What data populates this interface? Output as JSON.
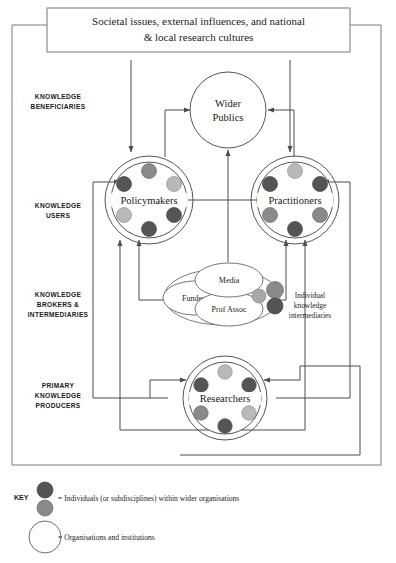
{
  "figure": {
    "banner": {
      "line1": "Societal issues, external influences, and national",
      "line2": "& local research cultures"
    },
    "tier_labels": [
      {
        "id": "beneficiaries",
        "line1": "KNOWLEDGE",
        "line2": "BENEFICIARIES",
        "line3": ""
      },
      {
        "id": "users",
        "line1": "KNOWLEDGE",
        "line2": "USERS",
        "line3": ""
      },
      {
        "id": "brokers",
        "line1": "KNOWLEDGE",
        "line2": "BROKERS &",
        "line3": "INTERMEDIARIES"
      },
      {
        "id": "producers",
        "line1": "PRIMARY",
        "line2": "KNOWLEDGE",
        "line3": "PRODUCERS"
      }
    ],
    "nodes": {
      "wider_publics": {
        "line1": "Wider",
        "line2": "Publics"
      },
      "policymakers": {
        "label": "Policymakers"
      },
      "practitioners": {
        "label": "Practitioners"
      },
      "researchers": {
        "label": "Researchers"
      },
      "media": {
        "label": "Media"
      },
      "funders": {
        "label": "Funders"
      },
      "prof_assoc": {
        "label": "Prof Assoc"
      }
    },
    "annotations": {
      "individual_intermediaries": {
        "line1": "Individual",
        "line2": "knowledge",
        "line3": "intermediaries"
      }
    },
    "key": {
      "title": "KEY",
      "items": [
        {
          "symbol": "filled-dots",
          "text": "= Individuals (or subdisciplines) within wider organisations"
        },
        {
          "symbol": "open-circle",
          "text": "= Organisations and institutions"
        }
      ]
    },
    "colors": {
      "dot_dark": "#555555",
      "dot_mid": "#8a8a8a",
      "dot_light": "#b9b9b9",
      "line": "#4a4a4a",
      "frame": "#7a7a7a",
      "background": "#ffffff"
    },
    "dot_groups": {
      "policymakers": [
        "mid",
        "dark",
        "light",
        "light",
        "dark",
        "dark"
      ],
      "practitioners": [
        "light",
        "dark",
        "dark",
        "mid",
        "mid",
        "dark"
      ],
      "researchers": [
        "light",
        "dark",
        "dark",
        "mid",
        "light",
        "dark"
      ],
      "intermediaries": [
        "mid",
        "mid",
        "dark"
      ]
    }
  }
}
